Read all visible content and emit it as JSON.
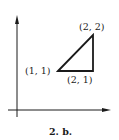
{
  "figure": {
    "caption": "2. b.",
    "colors": {
      "ink": "#1a1a1a",
      "background": "#ffffff"
    }
  },
  "diagram": {
    "axes": {
      "x_arrow": true,
      "y_arrow": true
    },
    "triangle": {
      "vertices": [
        {
          "label": "(1, 1)",
          "x": 1,
          "y": 1
        },
        {
          "label": "(2, 2)",
          "x": 2,
          "y": 2
        },
        {
          "label": "(2, 1)",
          "x": 2,
          "y": 1
        }
      ]
    }
  }
}
